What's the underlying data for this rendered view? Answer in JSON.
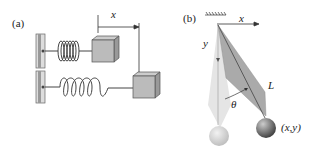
{
  "panel_a": {
    "label": "(a)",
    "x_label": "x"
  },
  "panel_b": {
    "label": "(b)",
    "x_label": "x",
    "y_label": "y",
    "theta_label": "θ",
    "length_label": "L",
    "point_label": "(x,y)"
  }
}
